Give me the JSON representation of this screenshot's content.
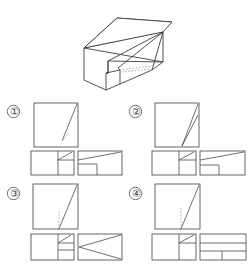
{
  "page": {
    "kind": "orthographic-projection-multiple-choice",
    "background_color": "#ffffff",
    "line_color": "#4a4a4a",
    "hidden_line_color": "#8a8a8a",
    "width": 251,
    "height": 277
  },
  "pictorial": {
    "name": "isometric-solid",
    "description": "Isometric rectangular block with a sloped wedge face on the right end and a small rectangular notch cut in the lower front edge",
    "caption": ""
  },
  "options": [
    {
      "id": "1",
      "label": "①",
      "front_view": {
        "name": "front-view",
        "shape": "square",
        "features": [
          "solid diagonal from bottom-left-of-center to top-right corner",
          "short hidden dashed line near lower diagonal"
        ]
      },
      "lower_left_view": {
        "name": "top-view",
        "shape": "rectangle",
        "features": [
          "horizontal divider at upper third",
          "small diagonal in upper-right cell",
          "vertical divider right of center",
          "small rectangle lower right"
        ]
      },
      "lower_right_view": {
        "name": "side-view",
        "shape": "rectangle",
        "features": [
          "long diagonal from mid-left to top-right corner",
          "step notch at bottom center forming small rectangle"
        ]
      }
    },
    {
      "id": "2",
      "label": "②",
      "front_view": {
        "name": "front-view",
        "shape": "square",
        "features": [
          "two solid lines converging at bottom-center meeting top-right corner",
          "narrow wedge"
        ]
      },
      "lower_left_view": {
        "name": "top-view",
        "shape": "rectangle",
        "features": [
          "horizontal divider at upper third",
          "small diagonal in upper-right cell",
          "vertical divider right of center",
          "small rectangle lower right"
        ]
      },
      "lower_right_view": {
        "name": "side-view",
        "shape": "rectangle",
        "features": [
          "long diagonal from mid-left to top-right corner",
          "step notch at bottom left forming small rectangle"
        ]
      }
    },
    {
      "id": "3",
      "label": "③",
      "front_view": {
        "name": "front-view",
        "shape": "square",
        "features": [
          "solid diagonal from bottom-center to top-right corner",
          "vertical hidden dashed line below diagonal"
        ]
      },
      "lower_left_view": {
        "name": "top-view",
        "shape": "rectangle",
        "features": [
          "horizontal divider at upper third",
          "small diagonal in upper-right cell",
          "vertical divider right of center",
          "second horizontal divider forming two small cells"
        ]
      },
      "lower_right_view": {
        "name": "side-view",
        "shape": "rectangle",
        "features": [
          "two diagonals radiating from mid-left point to top-right corner and to bottom-right corner"
        ]
      }
    },
    {
      "id": "4",
      "label": "④",
      "front_view": {
        "name": "front-view",
        "shape": "square",
        "features": [
          "solid diagonal from bottom-center to top-right corner",
          "vertical hidden dashed line below diagonal"
        ]
      },
      "lower_left_view": {
        "name": "top-view",
        "shape": "rectangle",
        "features": [
          "horizontal divider at upper third",
          "small diagonal in upper-right cell",
          "vertical divider right of center",
          "small rectangle lower right"
        ]
      },
      "lower_right_view": {
        "name": "side-view",
        "shape": "rectangle",
        "features": [
          "horizontal divider at upper third",
          "horizontal divider lower",
          "short vertical divider at center bottom"
        ]
      }
    }
  ]
}
